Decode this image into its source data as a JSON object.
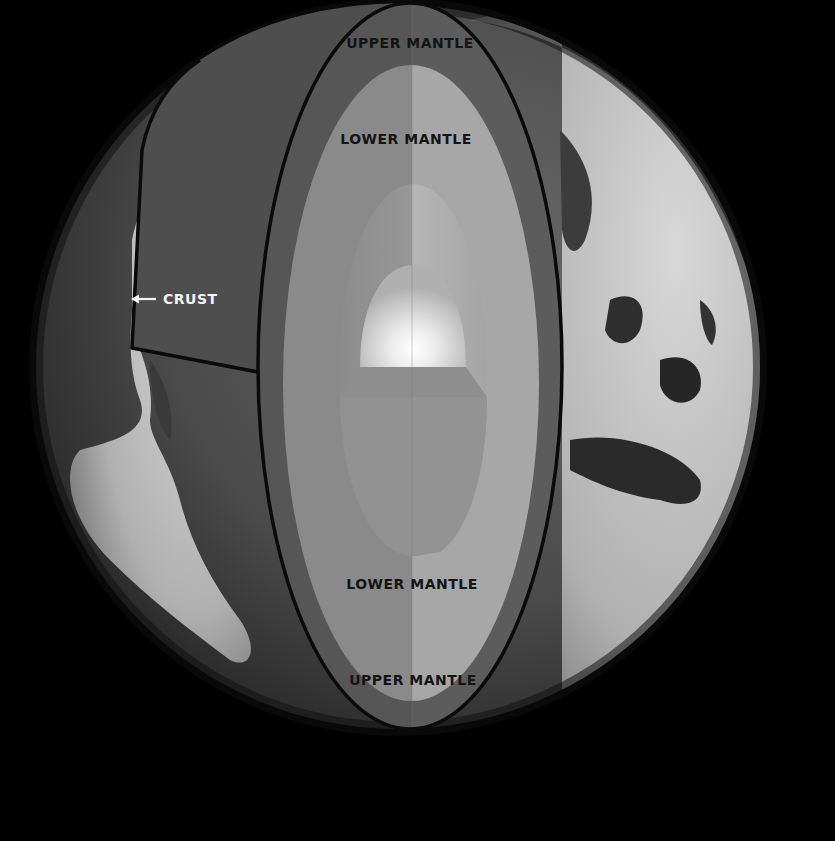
{
  "diagram": {
    "background_color": "#000000",
    "colors": {
      "globe_ocean": "#4a4a4a",
      "land": "#bdbdbd",
      "crust_section": "#4e4e4e",
      "upper_mantle": "#555555",
      "lower_mantle_left": "#8a8a8a",
      "lower_mantle_right": "#a6a6a6",
      "outer_core_left": "#939393",
      "outer_core_right": "#b6b6b6",
      "inner_core_glow": "#ffffff",
      "outline": "#0a0a0a"
    },
    "labels": {
      "upper_mantle_top": "UPPER MANTLE",
      "lower_mantle_top": "LOWER MANTLE",
      "crust": "CRUST",
      "lower_mantle_bottom": "LOWER MANTLE",
      "upper_mantle_bottom": "UPPER MANTLE"
    },
    "icons": {
      "crust_pointer": "arrow-left-icon"
    }
  }
}
